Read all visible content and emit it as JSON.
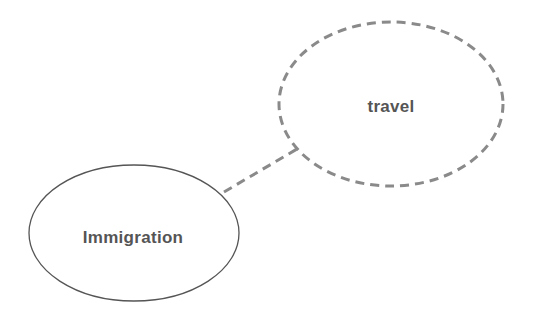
{
  "diagram": {
    "type": "concept-map",
    "nodes": [
      {
        "id": "immigration",
        "label": "Immigration",
        "style": "solid",
        "cx": 134,
        "cy": 233,
        "rx": 105,
        "ry": 68
      },
      {
        "id": "travel",
        "label": "travel",
        "style": "dashed",
        "cx": 391,
        "cy": 104,
        "rx": 112,
        "ry": 82
      }
    ],
    "edges": [
      {
        "from": "immigration",
        "to": "travel",
        "style": "dashed"
      }
    ],
    "colors": {
      "stroke_solid": "#555555",
      "stroke_dashed": "#8a8a8a",
      "text": "#555555",
      "background": "#ffffff"
    }
  }
}
